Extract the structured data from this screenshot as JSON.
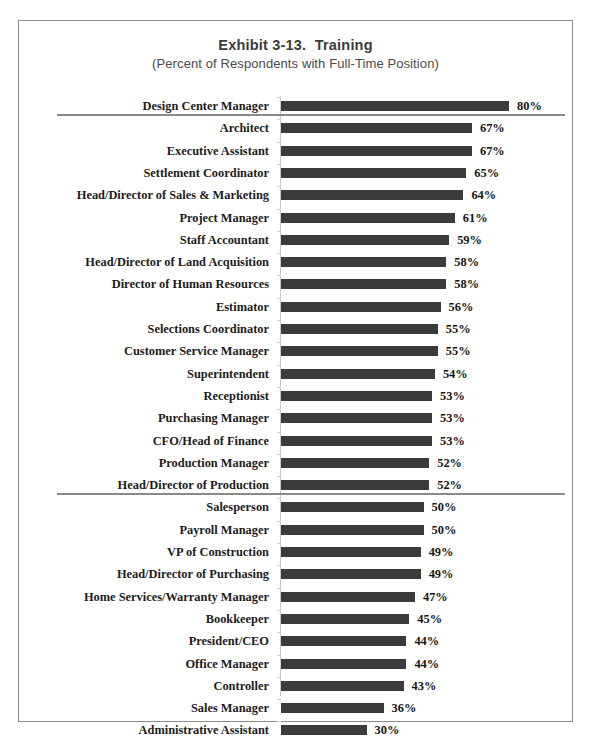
{
  "chart_data": {
    "type": "bar",
    "orientation": "horizontal",
    "title": "Exhibit 3-13.  Training",
    "subtitle": "(Percent of Respondents with Full-Time Position)",
    "xlabel": "",
    "ylabel": "",
    "xlim": [
      0,
      80
    ],
    "grid": false,
    "legend": null,
    "value_suffix": "%",
    "bar_color": "#3b3b3b",
    "divider_color": "#8a8a8a",
    "axis_color": "#c8c8c8",
    "dividers_after_rows": [
      1,
      18
    ],
    "categories": [
      "Design Center Manager",
      "Architect",
      "Executive Assistant",
      "Settlement Coordinator",
      "Head/Director of Sales & Marketing",
      "Project Manager",
      "Staff Accountant",
      "Head/Director of Land Acquisition",
      "Director of Human Resources",
      "Estimator",
      "Selections Coordinator",
      "Customer Service Manager",
      "Superintendent",
      "Receptionist",
      "Purchasing Manager",
      "CFO/Head of Finance",
      "Production Manager",
      "Head/Director of Production",
      "Salesperson",
      "Payroll Manager",
      "VP of Construction",
      "Head/Director of Purchasing",
      "Home Services/Warranty Manager",
      "Bookkeeper",
      "President/CEO",
      "Office Manager",
      "Controller",
      "Sales Manager",
      "Administrative Assistant"
    ],
    "values": [
      80,
      67,
      67,
      65,
      64,
      61,
      59,
      58,
      58,
      56,
      55,
      55,
      54,
      53,
      53,
      53,
      52,
      52,
      50,
      50,
      49,
      49,
      47,
      45,
      44,
      44,
      43,
      36,
      30
    ],
    "value_labels": [
      "80%",
      "67%",
      "67%",
      "65%",
      "64%",
      "61%",
      "59%",
      "58%",
      "58%",
      "56%",
      "55%",
      "55%",
      "54%",
      "53%",
      "53%",
      "53%",
      "52%",
      "52%",
      "50%",
      "50%",
      "49%",
      "49%",
      "47%",
      "45%",
      "44%",
      "44%",
      "43%",
      "36%",
      "30%"
    ]
  }
}
